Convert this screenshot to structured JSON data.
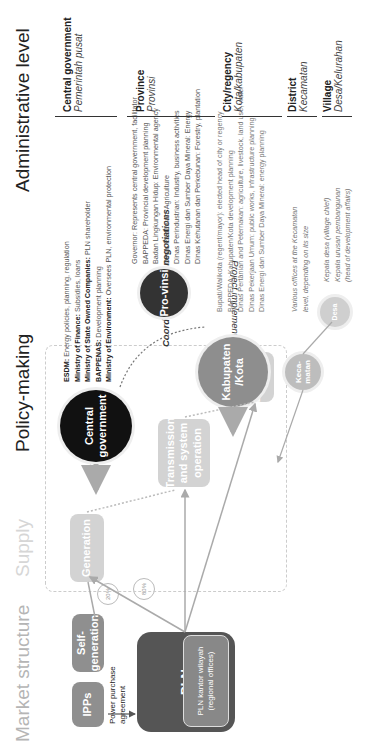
{
  "headers": {
    "market_structure": "Market structure",
    "supply": "Supply",
    "policy_making": "Policy-making",
    "administrative_level": "Administrative level"
  },
  "market": {
    "ipps": "IPPs",
    "self_generation": "Self-generation",
    "ppa_label": "Power purchase agreement",
    "pln": "PLN",
    "pln_regional": "PLN kantor wilayah (regional offices)",
    "pct_20": "20%",
    "pct_80": "80%"
  },
  "supply": {
    "generation": "Generation",
    "transmission": "Transmission and system operation",
    "distribution": "Distribution"
  },
  "arrows": {
    "framework": "Framework conditions",
    "project": "Project implementation",
    "coordination": "Coordination and negotiations"
  },
  "policy": {
    "central_circle": "Central government",
    "provinsi_circle": "Pro-vinsi",
    "kabupaten_circle": "Kabupaten /Kota",
    "kecamatan_circle": "Keca-matan",
    "desa_circle": "Desa",
    "central_lines": [
      {
        "bold": "ESDM:",
        "text": " Energy policies, planning, regulation"
      },
      {
        "bold": "Ministry of Finance:",
        "text": " Subsidies, loans"
      },
      {
        "bold": "Ministry of State Owned Companies:",
        "text": " PLN shareholder"
      },
      {
        "bold": "BAPPENAS:",
        "text": " Development planning"
      },
      {
        "bold": "Ministry of Environment:",
        "text": " Oversees PLN, environmental protection"
      }
    ],
    "province_lines": [
      "Governor: Represents central government, facilitator",
      "BAPPEDA: Provincial development planning",
      "Badan Lingkungan Hidup: Environmental agency",
      "Dinas Pertanian: Agriculture",
      "Dinas Perindustrian: Industry, business activities",
      "Dinas Energi dan Sumber Daya Mineral: Energy",
      "Dinas Kehutanan dan Perkebunan: Forestry, plantation"
    ],
    "kabupaten_lines": [
      "Bupati/Walikota (regent/mayor): elected head of city or regency",
      "BAPPEDA: Kabupaten/Kota development planning",
      "Dinas Pertanian and Peternakan: agriculture, livestock, land use, water",
      "Dinas Pekerjaan Umum: public works, infrastructure planning",
      "Dinas Energi dan Sumber Daya Mineral: energy planning"
    ],
    "kecamatan_lines": [
      "Various offices at the Kecamatan",
      "level, depending on its size"
    ],
    "desa_lines": [
      "Kepala desa (village chief)",
      "Kepala urusan pembangunan",
      "(head of development affairs)"
    ]
  },
  "admin_levels": [
    {
      "title": "Central government",
      "sub": "Pemerintah pusat"
    },
    {
      "title": "Province",
      "sub": "Provinsi"
    },
    {
      "title": "City/regency",
      "sub": "Kota/kabupaten"
    },
    {
      "title": "District",
      "sub": "Kecamatan"
    },
    {
      "title": "Village",
      "sub": "Desa/Kelurahan"
    }
  ]
}
